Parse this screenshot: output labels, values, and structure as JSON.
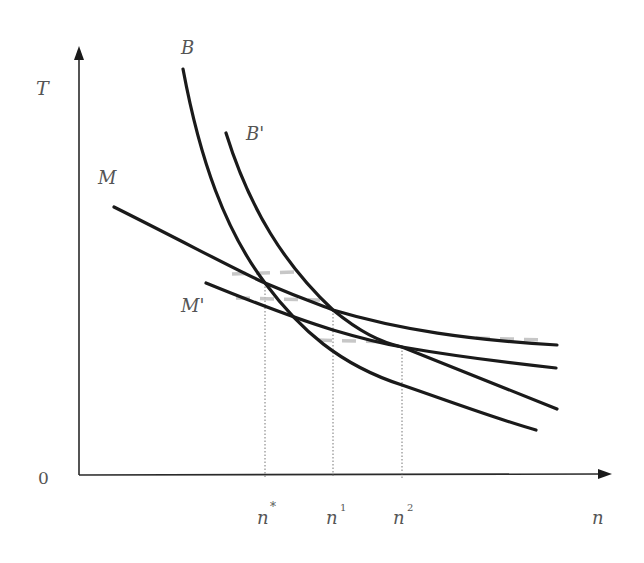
{
  "diagram": {
    "axes": {
      "y_label": "T",
      "x_label": "n",
      "origin_label": "0"
    },
    "curves": [
      {
        "id": "B",
        "label": "B",
        "type": "steep convex"
      },
      {
        "id": "Bp",
        "label": "B'",
        "type": "steep convex, shifted right"
      },
      {
        "id": "M",
        "label": "M",
        "type": "flat convex"
      },
      {
        "id": "Mp",
        "label": "M'",
        "type": "flat convex, shifted down"
      }
    ],
    "x_ticks": [
      {
        "base": "n",
        "sup": "*",
        "marks": "intersection of B and M"
      },
      {
        "base": "n",
        "sup": "1",
        "marks": "intersection of B' and M"
      },
      {
        "base": "n",
        "sup": "2",
        "marks": "intersection of B' and M'"
      }
    ],
    "colors": {
      "curve": "#1a1a1a",
      "label": "#555555",
      "guide": "#777777"
    }
  }
}
